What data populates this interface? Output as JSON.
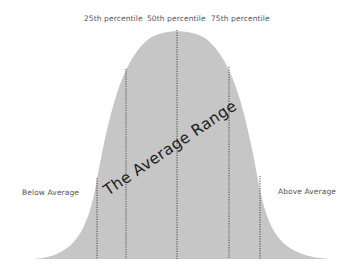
{
  "diagram": {
    "title": "The Average Range",
    "type": "bell-curve",
    "fill_color": "#c6c6c6",
    "line_color": "#3a3a3a",
    "text_color": "#555555",
    "labels": {
      "p25": "25th percentile",
      "p50": "50th percentile",
      "p75": "75th percentile",
      "below": "Below Average",
      "above": "Above Average"
    },
    "dividers": [
      {
        "name": "lower-bound",
        "x": 97
      },
      {
        "name": "25th-percentile",
        "x": 126
      },
      {
        "name": "50th-percentile",
        "x": 177
      },
      {
        "name": "75th-percentile",
        "x": 229
      },
      {
        "name": "upper-bound",
        "x": 260
      }
    ]
  }
}
